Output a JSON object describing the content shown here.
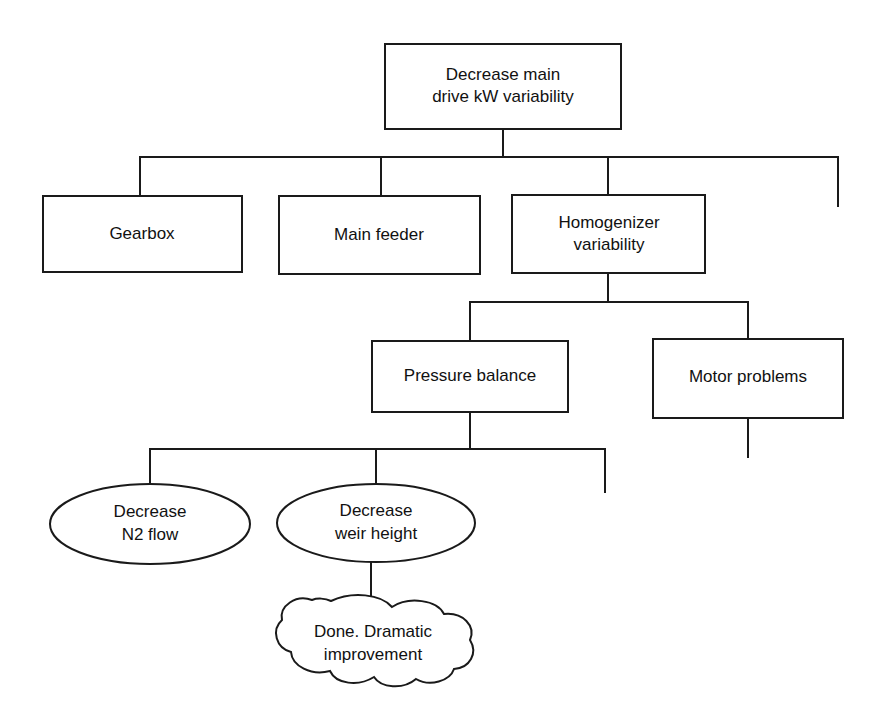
{
  "diagram": {
    "type": "tree-diagram",
    "background_color": "#ffffff",
    "line_color": "#1a1a1a",
    "text_color": "#111111",
    "nodes": [
      {
        "id": "root",
        "shape": "rectangle",
        "level": 0,
        "line1": "Decrease main",
        "line2": "drive kW variability"
      },
      {
        "id": "gearbox",
        "shape": "rectangle",
        "level": 1,
        "line1": "Gearbox",
        "line2": ""
      },
      {
        "id": "main-feeder",
        "shape": "rectangle",
        "level": 1,
        "line1": "Main feeder",
        "line2": ""
      },
      {
        "id": "homogenizer-variability",
        "shape": "rectangle",
        "level": 1,
        "line1": "Homogenizer",
        "line2": "variability"
      },
      {
        "id": "pressure-balance",
        "shape": "rectangle",
        "level": 2,
        "line1": "Pressure balance",
        "line2": ""
      },
      {
        "id": "motor-problems",
        "shape": "rectangle",
        "level": 2,
        "line1": "Motor problems",
        "line2": ""
      },
      {
        "id": "decrease-n2-flow",
        "shape": "ellipse",
        "level": 3,
        "line1": "Decrease",
        "line2": "N2 flow"
      },
      {
        "id": "decrease-weir-height",
        "shape": "ellipse",
        "level": 3,
        "line1": "Decrease",
        "line2": "weir height"
      },
      {
        "id": "done-dramatic-improvement",
        "shape": "cloud",
        "level": 4,
        "line1": "Done. Dramatic",
        "line2": "improvement"
      }
    ],
    "edges": [
      {
        "from": "root",
        "to": "gearbox"
      },
      {
        "from": "root",
        "to": "main-feeder"
      },
      {
        "from": "root",
        "to": "homogenizer-variability"
      },
      {
        "from": "root",
        "to": "open-branch-1"
      },
      {
        "from": "homogenizer-variability",
        "to": "pressure-balance"
      },
      {
        "from": "homogenizer-variability",
        "to": "motor-problems"
      },
      {
        "from": "motor-problems",
        "to": "open-branch-2"
      },
      {
        "from": "pressure-balance",
        "to": "decrease-n2-flow"
      },
      {
        "from": "pressure-balance",
        "to": "decrease-weir-height"
      },
      {
        "from": "pressure-balance",
        "to": "open-branch-3"
      },
      {
        "from": "decrease-weir-height",
        "to": "done-dramatic-improvement"
      }
    ]
  }
}
